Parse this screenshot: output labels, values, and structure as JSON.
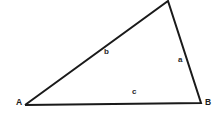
{
  "diagram": {
    "type": "triangle",
    "background_color": "#ffffff",
    "stroke_color": "#1a1a1a",
    "stroke_width": 2,
    "width": 220,
    "height": 115,
    "vertices": [
      {
        "name": "A",
        "label": "A",
        "x": 25,
        "y": 105,
        "label_x": 16,
        "label_y": 98
      },
      {
        "name": "B",
        "label": "B",
        "x": 201,
        "y": 103,
        "label_x": 205,
        "label_y": 98
      },
      {
        "name": "C",
        "label": "",
        "x": 168,
        "y": 1,
        "label_x": 0,
        "label_y": 0
      }
    ],
    "sides": [
      {
        "name": "a",
        "label": "a",
        "from": "B",
        "to": "C",
        "label_x": 178,
        "label_y": 56
      },
      {
        "name": "b",
        "label": "b",
        "from": "A",
        "to": "C",
        "label_x": 104,
        "label_y": 48
      },
      {
        "name": "c",
        "label": "c",
        "from": "A",
        "to": "B",
        "label_x": 132,
        "label_y": 88
      }
    ],
    "path": "M 25 105 L 168 1 L 201 103 Z"
  }
}
